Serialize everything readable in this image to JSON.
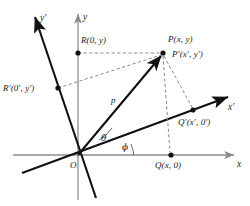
{
  "figure": {
    "colors": {
      "axis_primary": "#8c8c8c",
      "axis_rotated": "#111111",
      "vector": "#111111",
      "dashed": "#8a8a8a",
      "point": "#111111",
      "text": "#1a1a1a",
      "background": "#ffffff"
    }
  },
  "axes": [
    {
      "name": "x-axis",
      "label": "x",
      "label_x": 237,
      "label_y": 160
    },
    {
      "name": "y-axis",
      "label": "y",
      "label_x": 83,
      "label_y": 13
    },
    {
      "name": "x-prime-axis",
      "label": "x′",
      "label_x": 228,
      "label_y": 103
    },
    {
      "name": "y-prime-axis",
      "label": "y′",
      "label_x": 40,
      "label_y": 14
    }
  ],
  "points": [
    {
      "name": "origin",
      "label": "O",
      "label_x": 70,
      "label_y": 161,
      "px": 78,
      "py": 155
    },
    {
      "name": "point-p",
      "label": "P(x, y)",
      "label_x": 168,
      "label_y": 35,
      "px": 163,
      "py": 53
    },
    {
      "name": "point-p-prime",
      "label": "P′(x′, y′)",
      "label_x": 172,
      "label_y": 50,
      "px": 163,
      "py": 53
    },
    {
      "name": "point-q",
      "label": "Q(x, 0)",
      "label_x": 155,
      "label_y": 161,
      "px": 171,
      "py": 155
    },
    {
      "name": "point-q-prime",
      "label": "Q′(x′, 0′)",
      "label_x": 178,
      "label_y": 118,
      "px": 193,
      "py": 110
    },
    {
      "name": "point-r",
      "label": "R(0, y)",
      "label_x": 81,
      "label_y": 36,
      "px": 78,
      "py": 53
    },
    {
      "name": "point-r-prime",
      "label": "R′(0′, y′)",
      "label_x": 3,
      "label_y": 84,
      "px": 58,
      "py": 88
    }
  ],
  "annotations": [
    {
      "name": "vector-p-label",
      "label": "p",
      "label_x": 111,
      "label_y": 96
    },
    {
      "name": "angle-theta",
      "label": "θ",
      "label_x": 101,
      "label_y": 134
    },
    {
      "name": "angle-phi",
      "label": "ϕ",
      "label_x": 122,
      "label_y": 143
    }
  ]
}
